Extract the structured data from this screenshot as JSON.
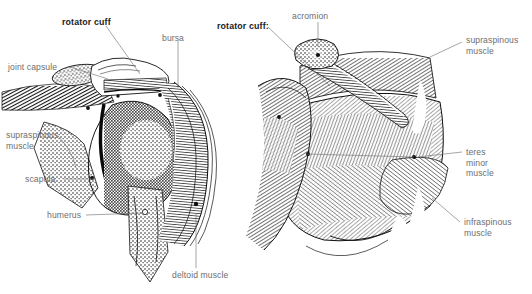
{
  "figure": {
    "background_color": "#ffffff",
    "label_color": "#6e6e6e",
    "emphasis_color": "#1a1a1a",
    "leader_color": "#767676"
  },
  "panels": [
    {
      "name": "left-panel",
      "view": "coronal-cross-section",
      "labels": [
        {
          "id": "rotator-cuff",
          "text": "rotator cuff",
          "emphasis": true,
          "x": 62,
          "y": 17,
          "align": "left"
        },
        {
          "id": "bursa",
          "text": "bursa",
          "emphasis": false,
          "x": 162,
          "y": 33,
          "align": "left"
        },
        {
          "id": "joint-capsule",
          "text": "joint capsule",
          "emphasis": false,
          "x": 8,
          "y": 62,
          "align": "left"
        },
        {
          "id": "supraspinous-muscle",
          "text": "supraspinous\nmuscle",
          "emphasis": false,
          "x": 6,
          "y": 130,
          "align": "left"
        },
        {
          "id": "scapula",
          "text": "scapula",
          "emphasis": false,
          "x": 25,
          "y": 176,
          "align": "left"
        },
        {
          "id": "humerus",
          "text": "humerus",
          "emphasis": false,
          "x": 47,
          "y": 212,
          "align": "left"
        },
        {
          "id": "deltoid-muscle",
          "text": "deltoid muscle",
          "emphasis": false,
          "x": 172,
          "y": 272,
          "align": "left"
        }
      ]
    },
    {
      "name": "right-panel",
      "view": "posterior",
      "labels": [
        {
          "id": "rotator-cuff-colon",
          "text": "rotator cuff:",
          "emphasis": true,
          "x": 217,
          "y": 21,
          "align": "left"
        },
        {
          "id": "acromion",
          "text": "acromion",
          "emphasis": false,
          "x": 292,
          "y": 11,
          "align": "left"
        },
        {
          "id": "supraspinous-muscle-right",
          "text": "supraspinous\nmuscle",
          "emphasis": false,
          "x": 466,
          "y": 35,
          "align": "left"
        },
        {
          "id": "teres-minor-muscle",
          "text": "teres\nminor\nmuscle",
          "emphasis": false,
          "x": 466,
          "y": 147,
          "align": "left"
        },
        {
          "id": "infraspinous-muscle",
          "text": "infraspinous\nmuscle",
          "emphasis": false,
          "x": 464,
          "y": 219,
          "align": "left"
        }
      ]
    }
  ],
  "anatomy_terms": [
    "rotator cuff",
    "bursa",
    "joint capsule",
    "supraspinous muscle",
    "scapula",
    "humerus",
    "deltoid muscle",
    "acromion",
    "teres minor muscle",
    "infraspinous muscle"
  ]
}
